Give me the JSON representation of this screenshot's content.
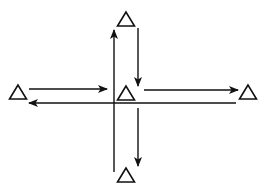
{
  "diagram": {
    "title": "",
    "stroke_color": "#111111",
    "background": "#ffffff",
    "nodes": [
      {
        "id": "top",
        "shape": "triangle",
        "cx": 126,
        "cy": 19
      },
      {
        "id": "center",
        "shape": "triangle",
        "cx": 126,
        "cy": 93
      },
      {
        "id": "left",
        "shape": "triangle",
        "cx": 18,
        "cy": 92
      },
      {
        "id": "right",
        "shape": "triangle",
        "cx": 248,
        "cy": 92
      },
      {
        "id": "bottom",
        "shape": "triangle",
        "cx": 126,
        "cy": 175
      }
    ],
    "edges": [
      {
        "id": "bottom-to-top",
        "x1": 114,
        "y1": 172,
        "x2": 114,
        "y2": 30,
        "direction": "up"
      },
      {
        "id": "top-to-center",
        "x1": 138,
        "y1": 28,
        "x2": 138,
        "y2": 86,
        "direction": "down"
      },
      {
        "id": "center-to-bottom",
        "x1": 138,
        "y1": 108,
        "x2": 138,
        "y2": 166,
        "direction": "down"
      },
      {
        "id": "left-to-center",
        "x1": 29,
        "y1": 89,
        "x2": 107,
        "y2": 89,
        "direction": "right"
      },
      {
        "id": "center-to-right",
        "x1": 144,
        "y1": 90,
        "x2": 238,
        "y2": 90,
        "direction": "right"
      },
      {
        "id": "right-to-left",
        "x1": 236,
        "y1": 103,
        "x2": 29,
        "y2": 103,
        "direction": "left"
      }
    ]
  }
}
